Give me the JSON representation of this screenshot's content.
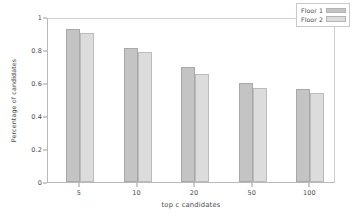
{
  "chart_data": {
    "type": "bar",
    "title": "",
    "xlabel": "top c candidates",
    "ylabel": "Percentage of candidates",
    "categories": [
      "5",
      "10",
      "20",
      "50",
      "100"
    ],
    "series": [
      {
        "name": "Floor 1",
        "color": "#c4c4c4",
        "values": [
          0.925,
          0.81,
          0.7,
          0.6,
          0.565
        ]
      },
      {
        "name": "Floor 2",
        "color": "#dcdcdc",
        "values": [
          0.905,
          0.79,
          0.655,
          0.572,
          0.54
        ]
      }
    ],
    "ylim": [
      0,
      1
    ],
    "yticks": [
      "0",
      "0.2",
      "0.4",
      "0.6",
      "0.8",
      "1"
    ],
    "ytick_values": [
      0,
      0.2,
      0.4,
      0.6,
      0.8,
      1
    ],
    "xticks": [
      "5",
      "10",
      "20",
      "50",
      "100"
    ],
    "grid": false,
    "legend_position": "upper right"
  }
}
